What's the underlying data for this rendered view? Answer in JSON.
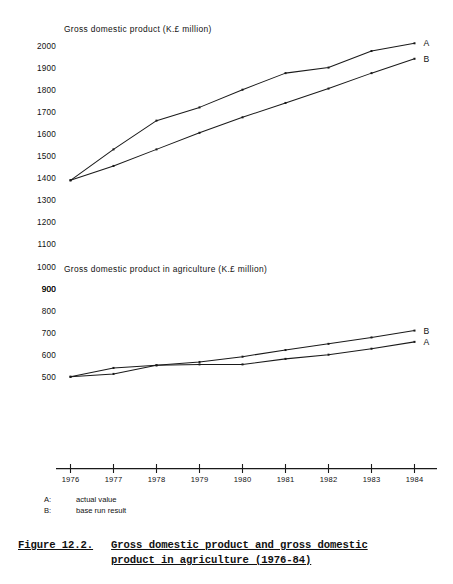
{
  "figure": {
    "number": "Figure 12.2.",
    "title_line1": "Gross domestic product and gross domestic",
    "title_line2": "product in agriculture (1976-84)"
  },
  "legend": {
    "entries": [
      {
        "key": "A:",
        "text": "actual value"
      },
      {
        "key": "B:",
        "text": "base run result"
      }
    ]
  },
  "colors": {
    "ink": "#1a1a1a",
    "paper": "#ffffff"
  },
  "chart_data": [
    {
      "id": "gdp-total",
      "type": "line",
      "title": "Gross domestic product (K.£ million)",
      "xlabel": "",
      "ylabel": "",
      "x": [
        1976,
        1977,
        1978,
        1979,
        1980,
        1981,
        1982,
        1983,
        1984
      ],
      "xticklabels": [
        "1976",
        "1977",
        "1978",
        "1979",
        "1980",
        "1981",
        "1982",
        "1983",
        "1984"
      ],
      "yticks": [
        900,
        1000,
        1100,
        1200,
        1300,
        1400,
        1500,
        1600,
        1700,
        1800,
        1900,
        2000
      ],
      "yticklabels": [
        "900",
        "1000",
        "1100",
        "1200",
        "1300",
        "1400",
        "1500",
        "1600",
        "1700",
        "1800",
        "1900",
        "2000"
      ],
      "ylim": [
        880,
        2020
      ],
      "xlim": [
        1975.6,
        1984.5
      ],
      "grid": false,
      "legend_position": "right-end-of-line",
      "series": [
        {
          "name": "A",
          "label": "A",
          "description": "actual value",
          "values": [
            1390,
            1530,
            1660,
            1720,
            1800,
            1875,
            1900,
            1975,
            2010
          ]
        },
        {
          "name": "B",
          "label": "B",
          "description": "base run result",
          "values": [
            1390,
            1455,
            1530,
            1605,
            1675,
            1740,
            1805,
            1875,
            1940
          ]
        }
      ]
    },
    {
      "id": "gdp-agriculture",
      "type": "line",
      "title": "Gross domestic product in agriculture (K.£ million)",
      "xlabel": "",
      "ylabel": "",
      "x": [
        1976,
        1977,
        1978,
        1979,
        1980,
        1981,
        1982,
        1983,
        1984
      ],
      "xticklabels": [
        "1976",
        "1977",
        "1978",
        "1979",
        "1980",
        "1981",
        "1982",
        "1983",
        "1984"
      ],
      "yticks": [
        500,
        600,
        700,
        800,
        900
      ],
      "yticklabels": [
        "500",
        "600",
        "700",
        "800",
        "900"
      ],
      "ylim": [
        880,
        2020
      ],
      "xlim": [
        1975.6,
        1984.5
      ],
      "grid": false,
      "legend_position": "right-end-of-line",
      "series": [
        {
          "name": "B",
          "label": "B",
          "description": "base run result",
          "values": [
            501,
            541,
            553,
            568,
            592,
            622,
            650,
            679,
            710
          ]
        },
        {
          "name": "A",
          "label": "A",
          "description": "actual value",
          "values": [
            501,
            514,
            553,
            557,
            557,
            582,
            601,
            628,
            659
          ]
        }
      ]
    }
  ]
}
